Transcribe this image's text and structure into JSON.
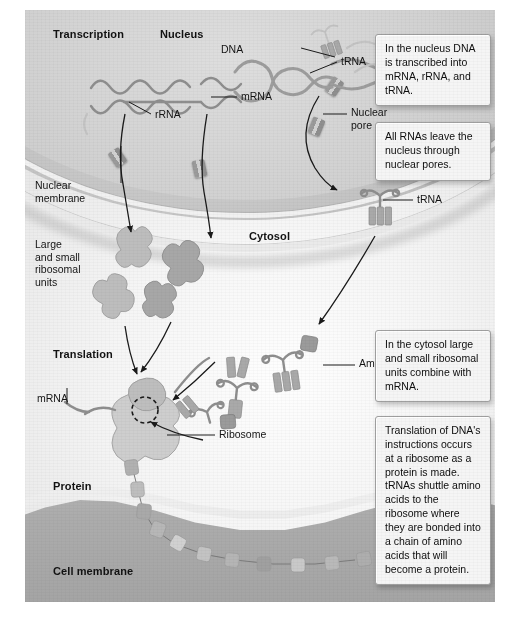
{
  "figure": {
    "style": "grayscale textbook illustration"
  },
  "section_labels": [
    {
      "key": "transcription",
      "text": "Transcription"
    },
    {
      "key": "nucleus",
      "text": "Nucleus"
    },
    {
      "key": "cytosol",
      "text": "Cytosol"
    },
    {
      "key": "translation",
      "text": "Translation"
    },
    {
      "key": "protein",
      "text": "Protein"
    },
    {
      "key": "cell_membrane",
      "text": "Cell membrane"
    }
  ],
  "part_labels": [
    {
      "key": "dna",
      "text": "DNA"
    },
    {
      "key": "trna_nucleus",
      "text": "tRNA"
    },
    {
      "key": "rrna",
      "text": "rRNA"
    },
    {
      "key": "mrna_nucleus",
      "text": "mRNA"
    },
    {
      "key": "nuclear_pore",
      "text": "Nuclear\npore"
    },
    {
      "key": "nuclear_membrane",
      "text": "Nuclear\nmembrane"
    },
    {
      "key": "ribosomal_units",
      "text": "Large\nand small\nribosomal\nunits"
    },
    {
      "key": "trna_cytosol",
      "text": "tRNA"
    },
    {
      "key": "amino_acid",
      "text": "Amino acid"
    },
    {
      "key": "mrna_translation",
      "text": "mRNA"
    },
    {
      "key": "ribosome",
      "text": "Ribosome"
    }
  ],
  "callouts": [
    {
      "key": "callout_nucleus",
      "text": "In the nucleus DNA is transcribed into mRNA, rRNA, and tRNA."
    },
    {
      "key": "callout_pores",
      "text": "All RNAs leave the nucleus through nuclear pores."
    },
    {
      "key": "callout_cytosol",
      "text": "In the cytosol large and small ribosomal units combine with mRNA."
    },
    {
      "key": "callout_translation",
      "text": "Translation of DNA's instructions occurs at a ribosome as a protein is made. tRNAs shuttle amino acids to the ribosome where they are bonded into a chain of amino acids that will become a protein."
    }
  ],
  "colors": {
    "page_background": "#ffffff",
    "plate_background": "#e9e9e9",
    "nucleus_fill": "#c8c8c8",
    "cytosol_fill": "#f3f3f3",
    "cell_membrane_fill": "#ababab",
    "callout_fill": "#f3f3f3",
    "callout_border": "#9e9e9e",
    "text": "#141414",
    "line": "#1c1c1c",
    "molecule_fill": "#a8a8a8"
  }
}
